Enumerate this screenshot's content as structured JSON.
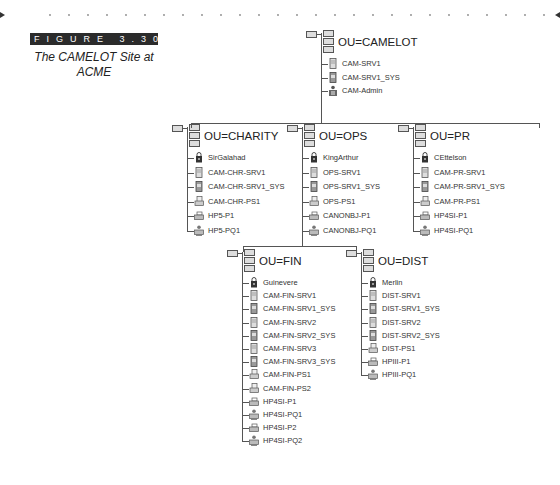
{
  "figure": {
    "badge": "FIGURE 3.30",
    "caption_line1": "The CAMELOT Site at",
    "caption_line2": "ACME"
  },
  "tree": {
    "root": {
      "label": "OU=CAMELOT",
      "items": [
        {
          "name": "CAM-SRV1",
          "icon": "server-icon"
        },
        {
          "name": "CAM-SRV1_SYS",
          "icon": "volume-icon"
        },
        {
          "name": "CAM-Admin",
          "icon": "admin-icon"
        }
      ]
    },
    "level1": [
      {
        "label": "OU=CHARITY",
        "items": [
          {
            "name": "SirGalahad",
            "icon": "user-icon"
          },
          {
            "name": "CAM-CHR-SRV1",
            "icon": "server-icon"
          },
          {
            "name": "CAM-CHR-SRV1_SYS",
            "icon": "volume-icon"
          },
          {
            "name": "CAM-CHR-PS1",
            "icon": "print-server-icon"
          },
          {
            "name": "HP5-P1",
            "icon": "printer-icon"
          },
          {
            "name": "HP5-PQ1",
            "icon": "print-queue-icon"
          }
        ]
      },
      {
        "label": "OU=OPS",
        "items": [
          {
            "name": "KingArthur",
            "icon": "user-icon"
          },
          {
            "name": "OPS-SRV1",
            "icon": "server-icon"
          },
          {
            "name": "OPS-SRV1_SYS",
            "icon": "volume-icon"
          },
          {
            "name": "OPS-PS1",
            "icon": "print-server-icon"
          },
          {
            "name": "CANONBJ-P1",
            "icon": "printer-icon"
          },
          {
            "name": "CANONBJ-PQ1",
            "icon": "print-queue-icon"
          }
        ]
      },
      {
        "label": "OU=PR",
        "items": [
          {
            "name": "CEttelson",
            "icon": "user-icon"
          },
          {
            "name": "CAM-PR-SRV1",
            "icon": "server-icon"
          },
          {
            "name": "CAM-PR-SRV1_SYS",
            "icon": "volume-icon"
          },
          {
            "name": "CAM-PR-PS1",
            "icon": "print-server-icon"
          },
          {
            "name": "HP4SI-P1",
            "icon": "printer-icon"
          },
          {
            "name": "HP4SI-PQ1",
            "icon": "print-queue-icon"
          }
        ]
      }
    ],
    "level2": [
      {
        "label": "OU=FIN",
        "items": [
          {
            "name": "Guinevere",
            "icon": "user-icon"
          },
          {
            "name": "CAM-FIN-SRV1",
            "icon": "server-icon"
          },
          {
            "name": "CAM-FIN-SRV1_SYS",
            "icon": "volume-icon"
          },
          {
            "name": "CAM-FIN-SRV2",
            "icon": "server-icon"
          },
          {
            "name": "CAM-FIN-SRV2_SYS",
            "icon": "volume-icon"
          },
          {
            "name": "CAM-FIN-SRV3",
            "icon": "server-icon"
          },
          {
            "name": "CAM-FIN-SRV3_SYS",
            "icon": "volume-icon"
          },
          {
            "name": "CAM-FIN-PS1",
            "icon": "print-server-icon"
          },
          {
            "name": "CAM-FIN-PS2",
            "icon": "print-server-icon"
          },
          {
            "name": "HP4SI-P1",
            "icon": "printer-icon"
          },
          {
            "name": "HP4SI-PQ1",
            "icon": "print-queue-icon"
          },
          {
            "name": "HP4SI-P2",
            "icon": "printer-icon"
          },
          {
            "name": "HP4SI-PQ2",
            "icon": "print-queue-icon"
          }
        ]
      },
      {
        "label": "OU=DIST",
        "items": [
          {
            "name": "Merlin",
            "icon": "user-icon"
          },
          {
            "name": "DIST-SRV1",
            "icon": "server-icon"
          },
          {
            "name": "DIST-SRV1_SYS",
            "icon": "volume-icon"
          },
          {
            "name": "DIST-SRV2",
            "icon": "server-icon"
          },
          {
            "name": "DIST-SRV2_SYS",
            "icon": "volume-icon"
          },
          {
            "name": "DIST-PS1",
            "icon": "print-server-icon"
          },
          {
            "name": "HPIII-P1",
            "icon": "printer-icon"
          },
          {
            "name": "HPIII-PQ1",
            "icon": "print-queue-icon"
          }
        ]
      }
    ]
  }
}
